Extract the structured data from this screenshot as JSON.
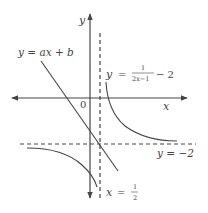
{
  "diagram": {
    "type": "function-graph",
    "axes": {
      "x_label": "x",
      "y_label": "y",
      "origin_label": "0"
    },
    "curves": [
      {
        "name": "hyperbola",
        "equation": "y = 1/(2x−1) − 2",
        "label_lhs": "y",
        "label_eq": "=",
        "label_num": "1",
        "label_den": "2x−1",
        "label_tail": "− 2"
      },
      {
        "name": "line",
        "equation": "y = ax + b",
        "label": "y = ax + b"
      }
    ],
    "asymptotes": {
      "horizontal": {
        "equation": "y = −2",
        "label": "y = −2"
      },
      "vertical": {
        "equation": "x = 1/2",
        "label_lhs": "x",
        "label_eq": "=",
        "label_num": "1",
        "label_den": "2"
      }
    },
    "colors": {
      "stroke": "#444444",
      "background": "#ffffff"
    }
  }
}
